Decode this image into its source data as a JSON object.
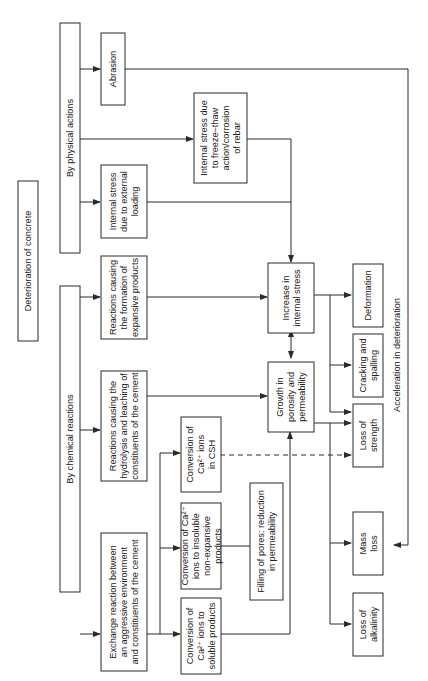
{
  "title": "Deterioration of concrete",
  "categories": {
    "physical": "By physical actions",
    "chemical": "By chemical reactions"
  },
  "nodes": {
    "abrasion": [
      "Abrasion"
    ],
    "freeze": [
      "Internal stress due",
      "to freeze–thaw",
      "action/corrosion",
      "of rebar"
    ],
    "external": [
      "Internal stress",
      "due to external",
      "loading"
    ],
    "expansive": [
      "Reactions causing",
      "the formation of",
      "expansive products"
    ],
    "hydrolysis": [
      "Reactions causing the",
      "hydrolysis and leaching of",
      "constituents of the cement"
    ],
    "exchange": [
      "Exchange reaction between",
      "an aggressive environment",
      "and constituents of the cement"
    ],
    "csh": [
      "Conversion of",
      "Ca²⁺ ions",
      "in CSH"
    ],
    "insoluble": [
      "Conversion of Ca²⁺",
      "ions to insoluble",
      "non-expansive",
      "products"
    ],
    "soluble": [
      "Conversion of",
      "Ca²⁺ ions to",
      "soluble products"
    ],
    "filling": [
      "Filling of pores: reduction",
      "in permeability"
    ],
    "stress": [
      "Increase in",
      "internal stress"
    ],
    "porosity": [
      "Growth in",
      "porosity and",
      "permeability"
    ],
    "deformation": [
      "Deformation"
    ],
    "cracking": [
      "Cracking and",
      "spalling"
    ],
    "strength": [
      "Loss of",
      "strength"
    ],
    "mass": [
      "Mass",
      "loss"
    ],
    "alkalinity": [
      "Loss of",
      "alkalinity"
    ]
  },
  "side_label": "Acceleration in deterioration"
}
